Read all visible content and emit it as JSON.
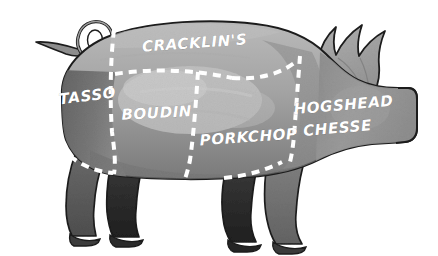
{
  "illustration": {
    "title": "Pig butcher cuts diagram",
    "subject": "pig",
    "style": "hand-drawn watercolor grayscale butcher chart",
    "background_color": "#ffffff"
  },
  "palette": {
    "outline": "#1c1c1c",
    "body_light": "#b4b4b4",
    "body_mid": "#9a9a9a",
    "body_shadow": "#7c7c7c",
    "haunch_dark": "#6d6d6d",
    "leg_dark": "#5a5a5a",
    "leg_darkest": "#2e2e2e",
    "head_gray": "#8e8e8e",
    "ear_gray": "#9f9f9f",
    "divider": "#ffffff",
    "label_text": "#ffffff"
  },
  "cuts": [
    {
      "id": "tasso",
      "label": "TASSO",
      "region": "rear ham / hind quarter",
      "x": 88,
      "y": 101,
      "rotate": -7,
      "font_size": 15
    },
    {
      "id": "cracklins",
      "label": "CRACKLIN'S",
      "region": "back / loin top",
      "x": 195,
      "y": 48,
      "rotate": -4,
      "font_size": 15
    },
    {
      "id": "boudin",
      "label": "BOUDIN",
      "region": "mid belly / side",
      "x": 157,
      "y": 118,
      "rotate": -3,
      "font_size": 15
    },
    {
      "id": "porkchop",
      "label": "PORKCHOP",
      "region": "shoulder / lower loin",
      "x": 249,
      "y": 142,
      "rotate": -4,
      "font_size": 15
    },
    {
      "id": "hogshead-chesse-line1",
      "label": "HOGSHEAD",
      "region": "head",
      "x": 344,
      "y": 110,
      "rotate": -5,
      "font_size": 15
    },
    {
      "id": "hogshead-chesse-line2",
      "label": "CHESSE",
      "region": "head",
      "x": 338,
      "y": 133,
      "rotate": -5,
      "font_size": 15
    }
  ],
  "dividers": {
    "style": "white dashed line",
    "dash_length": 8,
    "dash_gap": 6,
    "stroke_width": 4,
    "count": 6
  },
  "anatomy": {
    "tail": "curly looped tail, upper left",
    "ear": "jagged multi-point ear, upper right",
    "snout": "blunt squared snout, far right",
    "legs": "four legs, front pair darker than hind pair"
  }
}
